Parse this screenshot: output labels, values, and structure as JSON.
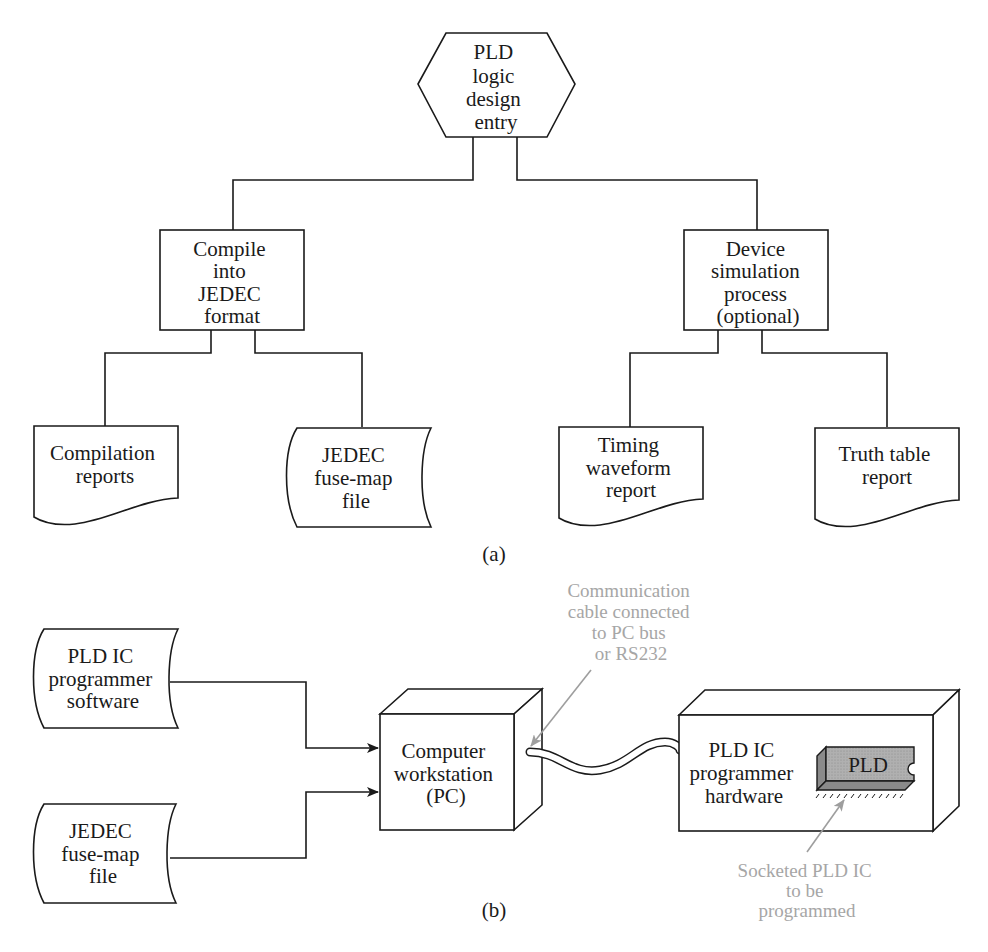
{
  "diagram_a": {
    "caption": "(a)",
    "root": {
      "lines": [
        "PLD",
        "logic",
        "design",
        "entry"
      ]
    },
    "compile": {
      "lines": [
        "Compile",
        "into",
        "JEDEC",
        "format"
      ]
    },
    "simulation": {
      "lines": [
        "Device",
        "simulation",
        "process",
        "(optional)"
      ]
    },
    "compilation_reports": {
      "lines": [
        "Compilation",
        "reports"
      ]
    },
    "jedec_file": {
      "lines": [
        "JEDEC",
        "fuse-map",
        "file"
      ]
    },
    "timing_report": {
      "lines": [
        "Timing",
        "waveform",
        "report"
      ]
    },
    "truth_table_report": {
      "lines": [
        "Truth table",
        "report"
      ]
    }
  },
  "diagram_b": {
    "caption": "(b)",
    "programmer_software": {
      "lines": [
        "PLD IC",
        "programmer",
        "software"
      ]
    },
    "jedec_file": {
      "lines": [
        "JEDEC",
        "fuse-map",
        "file"
      ]
    },
    "workstation": {
      "lines": [
        "Computer",
        "workstation",
        "(PC)"
      ]
    },
    "programmer_hardware": {
      "lines": [
        "PLD IC",
        "programmer",
        "hardware"
      ]
    },
    "chip_label": "PLD",
    "cable_annotation": {
      "lines": [
        "Communication",
        "cable connected",
        "to PC bus",
        "or RS232"
      ]
    },
    "socket_annotation": {
      "lines": [
        "Socketed PLD IC",
        "to be",
        "programmed"
      ]
    },
    "annotation_color": "#a6a6a6"
  }
}
